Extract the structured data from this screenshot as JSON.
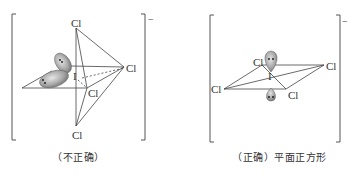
{
  "left": {
    "caption": "（不正确）",
    "charge": "−",
    "atoms": {
      "top": "Cl",
      "right": "Cl",
      "center": "I",
      "front": "Cl",
      "bottom": "Cl"
    }
  },
  "right": {
    "caption": "（正确）平面正方形",
    "charge": "−",
    "atoms": {
      "top_left": "Cl",
      "right": "Cl",
      "center": "I",
      "left": "Cl",
      "bottom_right": "Cl"
    }
  }
}
